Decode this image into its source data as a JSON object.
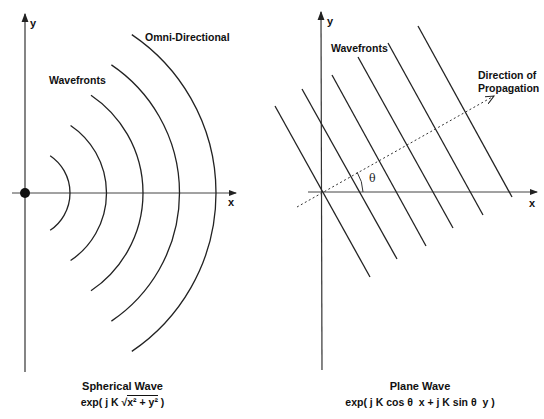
{
  "panels": [
    {
      "id": "spherical",
      "axis_labels": {
        "x": "x",
        "y": "y"
      },
      "annotations": {
        "wavefronts": "Wavefronts",
        "type_note": "Omni-Directional"
      },
      "caption_title": "Spherical Wave",
      "caption_formula_prefix": "exp( j K ",
      "caption_formula_root": "x² + y²",
      "caption_formula_suffix": " )",
      "wavefront_count": 5,
      "source_marker": "filled-dot"
    },
    {
      "id": "plane",
      "axis_labels": {
        "x": "x",
        "y": "y"
      },
      "annotations": {
        "wavefronts": "Wavefronts",
        "direction_line1": "Direction of",
        "direction_line2": "Propagation",
        "angle": "θ"
      },
      "caption_title": "Plane Wave",
      "caption_formula": "exp( j K cos θ  x + j K sin θ  y )",
      "wavefront_count": 6,
      "direction_angle_deg": 29
    }
  ]
}
